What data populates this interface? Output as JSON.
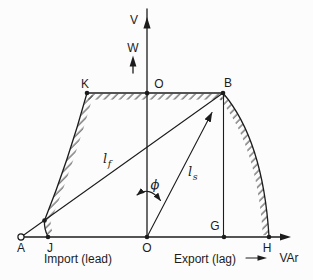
{
  "diagram": {
    "axes": {
      "v": "V",
      "w": "W",
      "var": "VAr"
    },
    "points": {
      "k": "K",
      "o_top": "O",
      "b": "B",
      "a": "A",
      "j": "J",
      "o_origin": "O",
      "g": "G",
      "h": "H"
    },
    "symbols": {
      "phi": "ϕ",
      "current_l": "l",
      "sub_f": "f",
      "sub_s": "s"
    },
    "regions": {
      "import_label": "Import (lead)",
      "export_label": "Export (lag)"
    },
    "colors": {
      "ink": "#1c1c1c",
      "background": "#fcfcfc"
    }
  }
}
